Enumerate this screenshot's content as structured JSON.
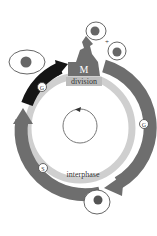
{
  "diagram": {
    "phases": {
      "mitosis_letter": "M",
      "mitosis_label": "division",
      "interphase_label": "interphase"
    },
    "stage_markers": [
      {
        "id": "g2",
        "letter": "G",
        "sub": "2"
      },
      {
        "id": "s",
        "letter": "S"
      },
      {
        "id": "g1",
        "letter": "G",
        "sub": "1"
      }
    ],
    "plus_sign": "+",
    "colors": {
      "arc_dark_gray": "#6b6b6b",
      "arc_black": "#151515",
      "inner_ring": "#c9c9c9",
      "nucleus": "#666666",
      "outline": "#555555"
    }
  }
}
